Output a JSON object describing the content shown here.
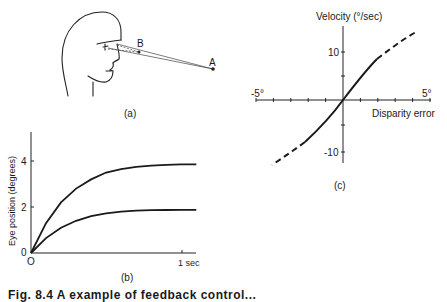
{
  "figure": {
    "caption": "Fig. 8.4 A  example of feedback control...",
    "panel_a": {
      "label": "(a)",
      "point_a_label": "A",
      "point_b_label": "B"
    },
    "panel_b": {
      "label": "(b)"
    },
    "panel_c": {
      "label": "(c)"
    }
  },
  "chart_data": [
    {
      "type": "line",
      "panel": "(b)",
      "title": "",
      "xlabel": "",
      "ylabel": "Eye position (degrees)",
      "x_ticks": [
        "O",
        "1 sec"
      ],
      "y_ticks": [
        "0",
        "2",
        "4"
      ],
      "xlim": [
        0,
        1.1
      ],
      "ylim": [
        0,
        5
      ],
      "grid": false,
      "x": [
        0,
        0.1,
        0.2,
        0.3,
        0.4,
        0.5,
        0.6,
        0.7,
        0.8,
        0.9,
        1.0,
        1.1
      ],
      "series": [
        {
          "name": "upper response",
          "values": [
            0,
            1.3,
            2.2,
            2.8,
            3.2,
            3.5,
            3.65,
            3.75,
            3.8,
            3.83,
            3.85,
            3.85
          ]
        },
        {
          "name": "lower response",
          "values": [
            0,
            0.65,
            1.1,
            1.4,
            1.6,
            1.72,
            1.8,
            1.84,
            1.86,
            1.87,
            1.88,
            1.88
          ]
        }
      ]
    },
    {
      "type": "line",
      "panel": "(c)",
      "title": "",
      "xlabel": "Disparity error",
      "ylabel": "Velocity (°/sec)",
      "x_ticks": [
        "-5°",
        "5°"
      ],
      "y_ticks": [
        "10",
        "-10"
      ],
      "xlim": [
        -5,
        5
      ],
      "ylim": [
        -12,
        14
      ],
      "grid": false,
      "series": [
        {
          "name": "measured (solid)",
          "x": [
            -2,
            -1,
            0,
            1,
            2
          ],
          "values": [
            -8,
            -4.5,
            0,
            4.5,
            8
          ]
        },
        {
          "name": "extrapolated upper (dashed)",
          "x": [
            2,
            3,
            4.3
          ],
          "values": [
            8,
            10.5,
            13.5
          ]
        },
        {
          "name": "extrapolated lower (dashed)",
          "x": [
            -2,
            -3,
            -4.3
          ],
          "values": [
            -8,
            -10.5,
            -13
          ]
        }
      ]
    }
  ]
}
